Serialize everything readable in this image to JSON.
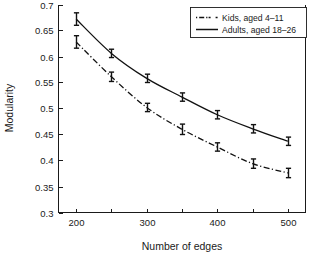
{
  "chart_data": {
    "type": "line",
    "title": "",
    "xlabel": "Number of edges",
    "ylabel": "Modularity",
    "x": [
      200,
      250,
      300,
      350,
      400,
      450,
      500
    ],
    "xlim": [
      175,
      525
    ],
    "ylim": [
      0.3,
      0.7
    ],
    "xticks": [
      200,
      250,
      300,
      350,
      400,
      450,
      500
    ],
    "xtick_labels": [
      "200",
      "",
      "300",
      "",
      "400",
      "",
      "500"
    ],
    "yticks": [
      0.3,
      0.35,
      0.4,
      0.45,
      0.5,
      0.55,
      0.6,
      0.65,
      0.7
    ],
    "ytick_labels": [
      "0.3",
      "0.35",
      "0.4",
      "0.45",
      "0.5",
      "0.55",
      "0.6",
      "0.65",
      "0.7"
    ],
    "grid": false,
    "legend_position": "top-right",
    "series": [
      {
        "name": "Kids, aged 4–11",
        "style": "dash-dot",
        "color": "#111111",
        "values": [
          0.628,
          0.561,
          0.502,
          0.46,
          0.426,
          0.394,
          0.376
        ],
        "errors": [
          0.012,
          0.009,
          0.008,
          0.01,
          0.008,
          0.009,
          0.009
        ]
      },
      {
        "name": "Adults, aged 18–26",
        "style": "solid",
        "color": "#111111",
        "values": [
          0.672,
          0.606,
          0.558,
          0.522,
          0.488,
          0.461,
          0.437
        ],
        "errors": [
          0.012,
          0.008,
          0.008,
          0.008,
          0.008,
          0.008,
          0.008
        ]
      }
    ]
  },
  "axes": {
    "ylabel": "Modularity",
    "xlabel": "Number of edges"
  },
  "legend": {
    "entries": [
      {
        "label": "Kids, aged 4–11"
      },
      {
        "label": "Adults, aged 18–26"
      }
    ]
  }
}
